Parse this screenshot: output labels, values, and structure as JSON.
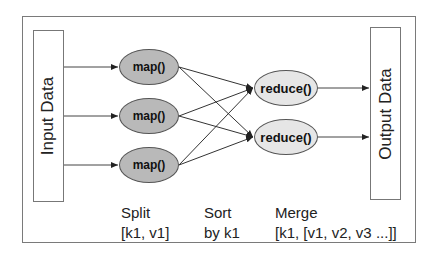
{
  "diagram": {
    "input": {
      "label": "Input Data"
    },
    "output": {
      "label": "Output Data"
    },
    "map_nodes": [
      {
        "label": "map()"
      },
      {
        "label": "map()"
      },
      {
        "label": "map()"
      }
    ],
    "reduce_nodes": [
      {
        "label": "reduce()"
      },
      {
        "label": "reduce()"
      }
    ],
    "stages": [
      {
        "title": "Split",
        "detail": "[k1, v1]"
      },
      {
        "title": "Sort",
        "detail": "by k1"
      },
      {
        "title": "Merge",
        "detail": "[k1, [v1, v2, v3 ...]]"
      }
    ],
    "colors": {
      "map_fill": "#b9b9b9",
      "reduce_fill": "#e6e6e6",
      "line": "#333333",
      "frame": "#7a7a7a"
    }
  }
}
